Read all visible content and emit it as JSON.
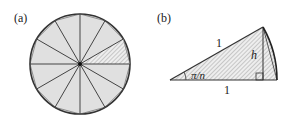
{
  "panels": [
    {
      "id": "a",
      "label": "(a)",
      "description": "Circle divided into 12 congruent triangular sectors; one sector shaded with hatching"
    },
    {
      "id": "b",
      "label": "(b)",
      "description": "Single triangle with circular arc; isosceles sides of length 1, apex angle pi/n, height h"
    }
  ],
  "figure_a": {
    "segments": 12,
    "hatched_segment_index": 1,
    "fill_color": "#e0e0e0",
    "stroke_color": "#333333"
  },
  "figure_b": {
    "side_top_label": "1",
    "side_bottom_label": "1",
    "height_label": "h",
    "angle_label": "π/n",
    "fill_color": "#e6e6e6"
  }
}
